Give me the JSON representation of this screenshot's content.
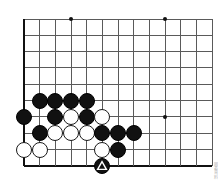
{
  "figure": {
    "type": "go-board-diagram",
    "credit_text": "囲碁資料",
    "colors": {
      "background": "#ffffff",
      "grid": "#5a5a5a",
      "edge": "#111111",
      "black_stone": "#111111",
      "white_stone": "#ffffff",
      "stone_outline": "#1a1a1a",
      "mark": "#ffffff"
    }
  },
  "board": {
    "columns": 13,
    "rows": 10,
    "origin_x": 24,
    "origin_y": 19,
    "step_x": 15.67,
    "step_y": 16.33,
    "stone_diameter": 16,
    "edges": {
      "left": true,
      "bottom": true,
      "top": false,
      "right": false
    },
    "star_points": [
      {
        "col": 3,
        "row": 0
      },
      {
        "col": 9,
        "row": 0
      },
      {
        "col": 9,
        "row": 6
      }
    ]
  },
  "stones": [
    {
      "col": 1,
      "row": 5,
      "color": "black",
      "mark": "none"
    },
    {
      "col": 2,
      "row": 5,
      "color": "black",
      "mark": "none"
    },
    {
      "col": 3,
      "row": 5,
      "color": "black",
      "mark": "none"
    },
    {
      "col": 4,
      "row": 5,
      "color": "black",
      "mark": "none"
    },
    {
      "col": 0,
      "row": 6,
      "color": "black",
      "mark": "none"
    },
    {
      "col": 2,
      "row": 6,
      "color": "black",
      "mark": "none"
    },
    {
      "col": 3,
      "row": 6,
      "color": "white",
      "mark": "none"
    },
    {
      "col": 4,
      "row": 6,
      "color": "black",
      "mark": "none"
    },
    {
      "col": 5,
      "row": 6,
      "color": "white",
      "mark": "none"
    },
    {
      "col": 1,
      "row": 7,
      "color": "black",
      "mark": "none"
    },
    {
      "col": 2,
      "row": 7,
      "color": "white",
      "mark": "none"
    },
    {
      "col": 3,
      "row": 7,
      "color": "white",
      "mark": "none"
    },
    {
      "col": 4,
      "row": 7,
      "color": "white",
      "mark": "none"
    },
    {
      "col": 5,
      "row": 7,
      "color": "black",
      "mark": "none"
    },
    {
      "col": 6,
      "row": 7,
      "color": "black",
      "mark": "none"
    },
    {
      "col": 7,
      "row": 7,
      "color": "black",
      "mark": "none"
    },
    {
      "col": 0,
      "row": 8,
      "color": "white",
      "mark": "none"
    },
    {
      "col": 1,
      "row": 8,
      "color": "white",
      "mark": "none"
    },
    {
      "col": 5,
      "row": 8,
      "color": "white",
      "mark": "none"
    },
    {
      "col": 6,
      "row": 8,
      "color": "black",
      "mark": "none"
    },
    {
      "col": 5,
      "row": 9,
      "color": "black",
      "mark": "triangle"
    }
  ]
}
